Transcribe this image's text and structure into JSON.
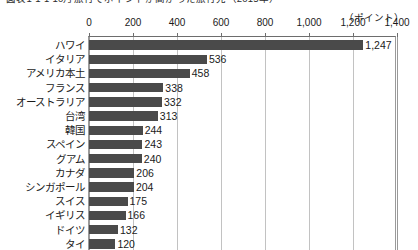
{
  "chart_data": {
    "type": "bar",
    "orientation": "horizontal",
    "title": "図表1-1-1 10月旅行でポイントが高かった旅行先（2015年）",
    "unit_label": "（ポイント）",
    "xlabel": "",
    "ylabel": "",
    "xlim": [
      0,
      1400
    ],
    "axis_position": "top",
    "grid": true,
    "legend": "none",
    "xticks": [
      0,
      200,
      400,
      600,
      800,
      1000,
      1200,
      1400
    ],
    "xtick_labels": [
      "0",
      "200",
      "400",
      "600",
      "800",
      "1,000",
      "1,200",
      "1,400"
    ],
    "categories": [
      "ハワイ",
      "イタリア",
      "アメリカ本土",
      "フランス",
      "オーストラリア",
      "台湾",
      "韓国",
      "スペイン",
      "グアム",
      "カナダ",
      "シンガポール",
      "スイス",
      "イギリス",
      "ドイツ",
      "タイ"
    ],
    "values": [
      1247,
      536,
      458,
      338,
      332,
      313,
      244,
      243,
      240,
      206,
      204,
      175,
      166,
      132,
      120
    ],
    "value_labels": [
      "1,247",
      "536",
      "458",
      "338",
      "332",
      "313",
      "244",
      "243",
      "240",
      "206",
      "204",
      "175",
      "166",
      "132",
      "120"
    ],
    "bar_color": "#4a4a4a",
    "grid_color": "#c2c2c2",
    "axis_color": "#6d6d6d",
    "background_color": "#ffffff"
  }
}
